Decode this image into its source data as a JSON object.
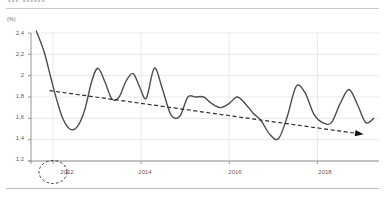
{
  "header": {
    "clipped_title": "•••  ••••••"
  },
  "axis_unit_label": "(%)",
  "annotation": {
    "highlight_label": "2012",
    "highlight_shape": "dashed-ellipse"
  },
  "chart_data": {
    "type": "line",
    "title": "",
    "subtitle": "",
    "xlabel": "",
    "ylabel": "(%)",
    "ylim": [
      1.2,
      2.4
    ],
    "yticks": [
      1.2,
      1.4,
      1.6,
      1.8,
      2.0,
      2.2,
      2.4
    ],
    "ytick_labels": [
      "1,2",
      "1,4",
      "1,6",
      "1,8",
      "2",
      "2,2",
      "2,4"
    ],
    "xlim": [
      2011.5,
      2019.4
    ],
    "xticks": [
      2012,
      2014,
      2016,
      2018
    ],
    "xtick_labels": [
      "2012",
      "2014",
      "2016",
      "2018"
    ],
    "grid": true,
    "grid_axis": "both",
    "legend": null,
    "legend_position": "none",
    "annotations": [
      {
        "type": "ellipse-highlight",
        "target": "xtick-2012",
        "label": "2012",
        "style": "dashed",
        "color": "#3a3a3a"
      },
      {
        "type": "arrow",
        "target": "trend-line-end",
        "style": "filled-triangle",
        "color": "#111111"
      }
    ],
    "series": [
      {
        "name": "value",
        "style": "solid",
        "color": "#4d4d4d",
        "width": 1.4,
        "smoothing": "spline",
        "x": [
          2011.62,
          2011.8,
          2011.95,
          2012.08,
          2012.22,
          2012.38,
          2012.55,
          2012.72,
          2012.88,
          2013.02,
          2013.18,
          2013.34,
          2013.5,
          2013.66,
          2013.82,
          2013.98,
          2014.12,
          2014.3,
          2014.48,
          2014.68,
          2014.88,
          2015.06,
          2015.24,
          2015.42,
          2015.6,
          2015.8,
          2016.0,
          2016.18,
          2016.36,
          2016.54,
          2016.72,
          2016.92,
          2017.12,
          2017.32,
          2017.52,
          2017.72,
          2017.92,
          2018.12,
          2018.32,
          2018.52,
          2018.72,
          2018.92,
          2019.1,
          2019.28
        ],
        "y": [
          2.42,
          2.22,
          1.98,
          1.78,
          1.6,
          1.5,
          1.52,
          1.68,
          1.95,
          2.07,
          1.94,
          1.78,
          1.8,
          1.95,
          2.02,
          1.88,
          1.79,
          2.07,
          1.88,
          1.63,
          1.62,
          1.8,
          1.8,
          1.8,
          1.74,
          1.7,
          1.74,
          1.8,
          1.74,
          1.65,
          1.58,
          1.45,
          1.41,
          1.62,
          1.9,
          1.84,
          1.64,
          1.56,
          1.56,
          1.74,
          1.87,
          1.72,
          1.56,
          1.6
        ]
      },
      {
        "name": "trend",
        "style": "dashed",
        "color": "#2e2e2e",
        "width": 1.2,
        "x": [
          2011.92,
          2019.05
        ],
        "y": [
          1.86,
          1.45
        ]
      }
    ]
  }
}
